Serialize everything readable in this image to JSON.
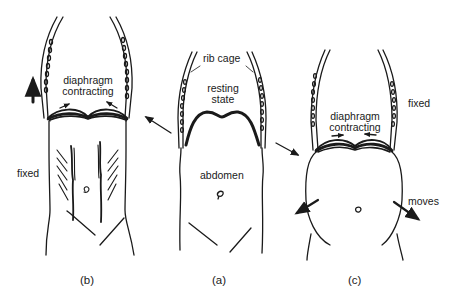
{
  "diagram": {
    "panels": [
      {
        "id": "b",
        "label": "(b)",
        "state_text_line1": "diaphragm",
        "state_text_line2": "contracting",
        "side_label": "fixed",
        "movement": "rib cage rises (upward arrow); abdomen fixed with contracted abdominal muscles"
      },
      {
        "id": "a",
        "label": "(a)",
        "top_label": "rib cage",
        "state_text_line1": "resting",
        "state_text_line2": "state",
        "body_label": "abdomen",
        "movement": "resting diaphragm dome"
      },
      {
        "id": "c",
        "label": "(c)",
        "state_text_line1": "diaphragm",
        "state_text_line2": "contracting",
        "side_label_top": "fixed",
        "side_label_bottom": "moves",
        "movement": "rib cage fixed; abdomen bulges outward"
      }
    ],
    "connectors": [
      {
        "from": "a",
        "to": "b",
        "direction": "up-left"
      },
      {
        "from": "a",
        "to": "c",
        "direction": "down-right"
      }
    ],
    "colors": {
      "ink": "#1a1a1a",
      "background": "#ffffff"
    }
  }
}
